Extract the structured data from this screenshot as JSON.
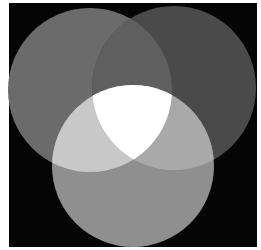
{
  "diagram": {
    "type": "three-circle-venn",
    "background": {
      "x": 9,
      "y": 3,
      "width": 248,
      "height": 244,
      "color": "#050505"
    },
    "circles": [
      {
        "id": "left",
        "cx": 90,
        "cy": 90,
        "r": 82,
        "color": "#6b6b6b"
      },
      {
        "id": "right",
        "cx": 174,
        "cy": 88,
        "r": 82,
        "color": "#4a4a4a"
      },
      {
        "id": "bottom",
        "cx": 133,
        "cy": 166,
        "r": 81,
        "color": "#8f8f8f"
      }
    ],
    "intersections": {
      "left_right": "#5f5f5f",
      "left_bottom": "#c8c8c8",
      "right_bottom": "#a9a9a9",
      "all": "#ffffff"
    }
  }
}
